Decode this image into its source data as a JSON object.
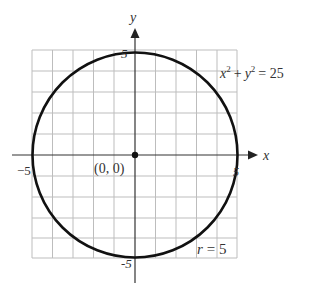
{
  "diagram": {
    "type": "circle-on-grid",
    "equation_label": "x² + y² = 25",
    "equation": {
      "x": "x",
      "x_exp": "2",
      "plus": "+",
      "y": "y",
      "y_exp": "2",
      "eq": "= 25"
    },
    "radius_label": {
      "r": "r",
      "rest": "= 5"
    },
    "center_label": "(0, 0)",
    "axes": {
      "x_label": "x",
      "y_label": "y"
    },
    "ticks": {
      "top": "5",
      "bottom": "-5",
      "left": "−5",
      "right": "5"
    },
    "grid": {
      "cells_x": 10,
      "cells_y": 10,
      "range": [
        -5,
        5
      ]
    },
    "colors": {
      "curve": "#111111",
      "grid": "#bdbdbd",
      "axis": "#333333",
      "text": "#333333"
    }
  }
}
